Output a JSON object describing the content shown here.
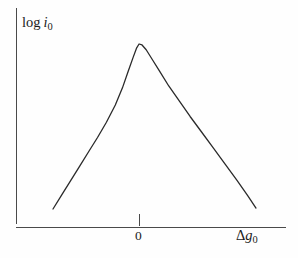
{
  "figure": {
    "background_color": "#fefefe",
    "line_color": "#2a2a2a",
    "axis_color": "#4a4a4a"
  },
  "labels": {
    "y_axis": {
      "prefix": "log",
      "symbol": "i",
      "subscript": "0",
      "full_text": "log i0"
    },
    "x_axis": {
      "delta": "Δ",
      "symbol": "g",
      "subscript": "0",
      "full_text": "Δg0"
    },
    "x_tick_zero": "0"
  },
  "chart_data": {
    "type": "line",
    "title": "",
    "xlabel": "Δg0",
    "ylabel": "log i0",
    "grid": false,
    "legend": null,
    "xticks": [
      "0"
    ],
    "xtick_positions": [
      0
    ],
    "yticks": [],
    "xlim": [
      -1.45,
      1.97
    ],
    "ylim": [
      0,
      1.0
    ],
    "series": [
      {
        "name": "volcano curve",
        "x": [
          -1.45,
          -1.3,
          -1.15,
          -1.0,
          -0.85,
          -0.7,
          -0.55,
          -0.4,
          -0.28,
          -0.18,
          -0.1,
          -0.04,
          0.0,
          0.05,
          0.12,
          0.22,
          0.34,
          0.5,
          0.68,
          0.86,
          1.05,
          1.25,
          1.45,
          1.65,
          1.83,
          1.97
        ],
        "y": [
          0.1,
          0.175,
          0.25,
          0.325,
          0.4,
          0.475,
          0.555,
          0.645,
          0.735,
          0.825,
          0.895,
          0.945,
          0.965,
          0.96,
          0.935,
          0.885,
          0.825,
          0.745,
          0.665,
          0.585,
          0.505,
          0.42,
          0.335,
          0.25,
          0.17,
          0.105
        ]
      }
    ]
  }
}
